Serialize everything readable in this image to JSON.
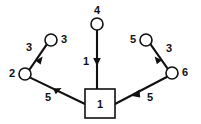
{
  "diagram": {
    "type": "directed-weighted-graph",
    "title": "",
    "background_color": "#ffffff",
    "stroke_color": "#111111",
    "nodes": [
      {
        "id": "n4",
        "label": "4",
        "shape": "circle",
        "cx": 97,
        "cy": 24,
        "r": 6,
        "label_x": 97,
        "label_y": 11,
        "label_anchor": "middle"
      },
      {
        "id": "n3",
        "label": "3",
        "shape": "circle",
        "cx": 51,
        "cy": 40,
        "r": 6,
        "label_x": 61,
        "label_y": 40,
        "label_anchor": "start"
      },
      {
        "id": "n5",
        "label": "5",
        "shape": "circle",
        "cx": 146,
        "cy": 40,
        "r": 6,
        "label_x": 136,
        "label_y": 40,
        "label_anchor": "end"
      },
      {
        "id": "n2",
        "label": "2",
        "shape": "circle",
        "cx": 25,
        "cy": 74,
        "r": 6,
        "label_x": 15,
        "label_y": 74,
        "label_anchor": "end"
      },
      {
        "id": "n6",
        "label": "6",
        "shape": "circle",
        "cx": 172,
        "cy": 73,
        "r": 6,
        "label_x": 182,
        "label_y": 73,
        "label_anchor": "start"
      },
      {
        "id": "n1",
        "label": "1",
        "shape": "square",
        "cx": 100,
        "cy": 104,
        "x": 85,
        "y": 89,
        "width": 30,
        "height": 29
      }
    ],
    "edges": [
      {
        "id": "e-4-1",
        "from": "n4",
        "to": "n1",
        "weight": "1",
        "weight_x": 86,
        "weight_y": 62,
        "weight_anchor": "middle",
        "direction": "down"
      },
      {
        "id": "e-3-2",
        "from": "n3",
        "to": "n2",
        "weight": "3",
        "weight_x": 29,
        "weight_y": 48,
        "weight_anchor": "middle",
        "direction": "down-left"
      },
      {
        "id": "e-5-6",
        "from": "n5",
        "to": "n6",
        "weight": "3",
        "weight_x": 169,
        "weight_y": 49,
        "weight_anchor": "middle",
        "direction": "down-right"
      },
      {
        "id": "e-1-2",
        "from": "n1",
        "to": "n2",
        "weight": "5",
        "weight_x": 48,
        "weight_y": 98,
        "weight_anchor": "middle",
        "direction": "up-left"
      },
      {
        "id": "e-6-1",
        "from": "n6",
        "to": "n1",
        "weight": "5",
        "weight_x": 150,
        "weight_y": 98,
        "weight_anchor": "middle",
        "direction": "down-left"
      }
    ]
  }
}
